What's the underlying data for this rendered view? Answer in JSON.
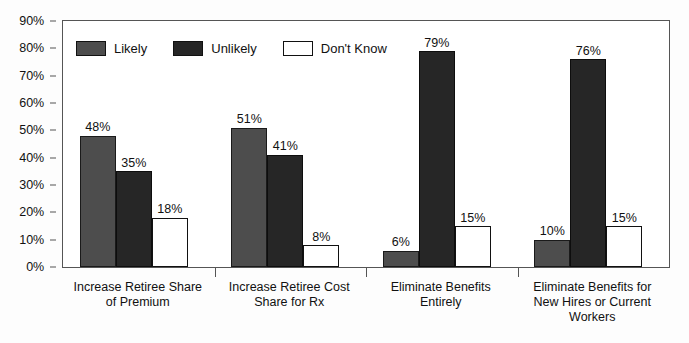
{
  "chart_data": {
    "type": "bar",
    "title": "",
    "subtitle": "",
    "xlabel": "",
    "ylabel": "",
    "ylim": [
      0,
      90
    ],
    "ytick_labels": [
      "0%",
      "10%",
      "20%",
      "30%",
      "40%",
      "50%",
      "60%",
      "70%",
      "80%",
      "90%"
    ],
    "ytick_values": [
      0,
      10,
      20,
      30,
      40,
      50,
      60,
      70,
      80,
      90
    ],
    "grid": false,
    "legend_position": "top-left-inside",
    "categories": [
      "Increase Retiree Share of Premium",
      "Increase Retiree Cost Share for Rx",
      "Eliminate Benefits Entirely",
      "Eliminate Benefits for New Hires or Current Workers"
    ],
    "category_lines": [
      [
        "Increase Retiree Share",
        "of Premium"
      ],
      [
        "Increase Retiree Cost",
        "Share for Rx"
      ],
      [
        "Eliminate Benefits",
        "Entirely"
      ],
      [
        "Eliminate Benefits for",
        "New Hires or Current",
        "Workers"
      ]
    ],
    "series": [
      {
        "name": "Likely",
        "color": "#4d4d4d",
        "values": [
          48,
          51,
          6,
          10
        ],
        "labels": [
          "48%",
          "51%",
          "6%",
          "10%"
        ]
      },
      {
        "name": "Unlikely",
        "color": "#262626",
        "values": [
          35,
          41,
          79,
          76
        ],
        "labels": [
          "35%",
          "41%",
          "79%",
          "76%"
        ]
      },
      {
        "name": "Don't Know",
        "color": "#ffffff",
        "values": [
          18,
          8,
          15,
          15
        ],
        "labels": [
          "18%",
          "8%",
          "15%",
          "15%"
        ]
      }
    ]
  },
  "legend": {
    "items": [
      {
        "label": "Likely",
        "swatch_class": "sw-likely"
      },
      {
        "label": "Unlikely",
        "swatch_class": "sw-unlikely"
      },
      {
        "label": "Don't Know",
        "swatch_class": "sw-dk"
      }
    ]
  }
}
